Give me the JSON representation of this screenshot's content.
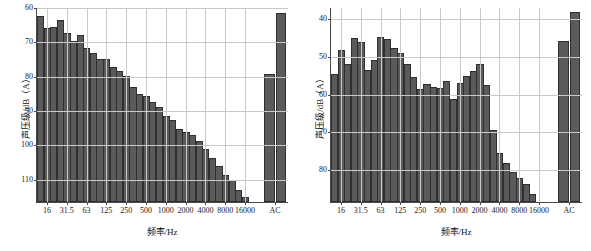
{
  "figure": {
    "background": "#ffffff",
    "bar_fill": "#5a5a5a",
    "bar_edge": "#2f2f2f",
    "grid_color": "#c9c9c9",
    "axis_color": "#4a4a4a"
  },
  "panels": [
    {
      "id": "left",
      "ylabel": "声压级/dB（A）",
      "xlabel": "频率/Hz",
      "yticks": [
        "110",
        "100",
        "90",
        "80",
        "70",
        "60"
      ],
      "xticks": [
        "16",
        "31.5",
        "63",
        "125",
        "250",
        "500",
        "1000",
        "2000",
        "4000",
        "8000",
        "16000",
        "AC"
      ]
    },
    {
      "id": "right",
      "ylabel": "声压级/dB（A）",
      "xlabel": "频率/Hz",
      "yticks": [
        "80",
        "70",
        "60",
        "50",
        "40"
      ],
      "xticks": [
        "16",
        "31.5",
        "63",
        "125",
        "250",
        "500",
        "1000",
        "2000",
        "4000",
        "8000",
        "16000",
        "AC"
      ]
    }
  ],
  "chart_data": [
    {
      "type": "bar",
      "panel": "left",
      "title": "",
      "xlabel": "频率/Hz",
      "ylabel": "声压级/dB（A）",
      "xscale": "log (1/3-octave bands)",
      "ylim": [
        53.2,
        110
      ],
      "yticks": [
        60,
        70,
        80,
        90,
        100,
        110
      ],
      "grid": true,
      "legend": "none",
      "categories": [
        "12.5",
        "16",
        "20",
        "25",
        "31.5",
        "40",
        "50",
        "63",
        "80",
        "100",
        "125",
        "160",
        "200",
        "250",
        "315",
        "400",
        "500",
        "630",
        "800",
        "1000",
        "1250",
        "1600",
        "2000",
        "2500",
        "3150",
        "4000",
        "5000",
        "6300",
        "8000",
        "10000",
        "12500",
        "16000",
        "20000"
      ],
      "xtick_labels": [
        "16",
        "31.5",
        "63",
        "125",
        "250",
        "500",
        "1000",
        "2000",
        "4000",
        "8000",
        "16000"
      ],
      "values": [
        107.4,
        103.8,
        104.3,
        106.1,
        102.4,
        100.1,
        101.8,
        98.2,
        96.6,
        94.8,
        94.8,
        92.6,
        91.3,
        90.0,
        86.6,
        84.7,
        84.1,
        82.3,
        81.0,
        78.4,
        77.0,
        74.5,
        73.7,
        72.7,
        70.9,
        68.5,
        66.0,
        63.6,
        61.2,
        59.7,
        56.8,
        54.7,
        null
      ],
      "extra_group": {
        "label": "AC",
        "categories": [
          "A",
          "C"
        ],
        "values": [
          90.6,
          108.4
        ]
      }
    },
    {
      "type": "bar",
      "panel": "right",
      "title": "",
      "xlabel": "频率/Hz",
      "ylabel": "声压级/dB（A）",
      "xscale": "log (1/3-octave bands)",
      "ylim": [
        31.3,
        83
      ],
      "yticks": [
        40,
        50,
        60,
        70,
        80
      ],
      "grid": true,
      "legend": "none",
      "categories": [
        "12.5",
        "16",
        "20",
        "25",
        "31.5",
        "40",
        "50",
        "63",
        "80",
        "100",
        "125",
        "160",
        "200",
        "250",
        "315",
        "400",
        "500",
        "630",
        "800",
        "1000",
        "1250",
        "1600",
        "2000",
        "2500",
        "3150",
        "4000",
        "5000",
        "6300",
        "8000",
        "10000",
        "12500",
        "16000",
        "20000"
      ],
      "xtick_labels": [
        "16",
        "31.5",
        "63",
        "125",
        "250",
        "500",
        "1000",
        "2000",
        "4000",
        "8000",
        "16000"
      ],
      "values": [
        65.2,
        71.7,
        68.0,
        74.7,
        73.7,
        66.3,
        68.9,
        75.1,
        74.6,
        72.2,
        70.9,
        67.9,
        64.4,
        61.2,
        62.5,
        61.8,
        61.4,
        63.4,
        58.6,
        62.8,
        64.6,
        66.1,
        67.9,
        62.2,
        50.4,
        44.2,
        41.6,
        39.2,
        37.7,
        36.2,
        33.5,
        null,
        null
      ],
      "extra_group": {
        "label": "AC",
        "categories": [
          "A",
          "C"
        ],
        "values": [
          74.0,
          81.6
        ]
      }
    }
  ]
}
